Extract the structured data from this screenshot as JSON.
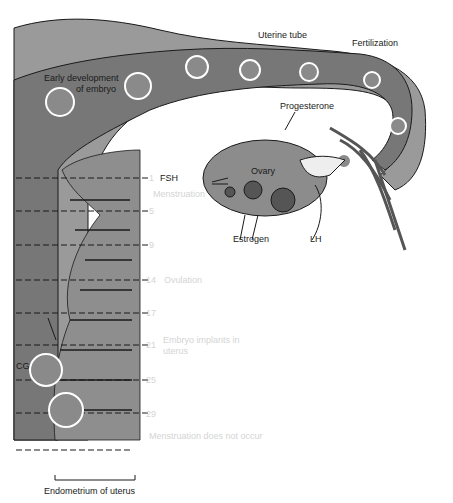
{
  "figure": {
    "colors": {
      "wall_light": "#9a9a9a",
      "lumen_dark": "#777777",
      "endometrium": "#8e8e8e",
      "ovary": "#8c8c8c",
      "ink": "#1a1a1a",
      "faint_text": "#d4d4d4"
    },
    "labels": {
      "uterine_tube": "Uterine tube",
      "fertilization": "Fertilization",
      "early_development_1": "Early development",
      "early_development_2": "of embryo",
      "progesterone": "Progesterone",
      "ovary": "Ovary",
      "fsh": "FSH",
      "estrogen": "Estrogen",
      "lh": "LH",
      "cg": "CG",
      "endometrium": "Endometrium of uterus"
    },
    "cycle_days": [
      {
        "day": "1",
        "note": "Menstruation"
      },
      {
        "day": "5",
        "note": ""
      },
      {
        "day": "9",
        "note": ""
      },
      {
        "day": "14",
        "note": "Ovulation"
      },
      {
        "day": "17",
        "note": ""
      },
      {
        "day": "21",
        "note": "Embryo implants in"
      },
      {
        "day": "25",
        "note": ""
      },
      {
        "day": "29",
        "note": ""
      }
    ],
    "extra_notes": {
      "implant_line2": "uterus",
      "no_menstruation": "Menstruation does not occur"
    }
  }
}
